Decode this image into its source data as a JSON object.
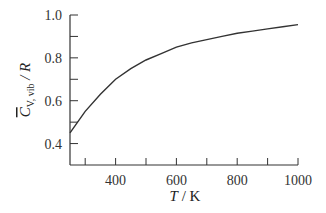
{
  "chart_data": {
    "type": "line",
    "title": "",
    "xlabel": "T / K",
    "ylabel": "C̄V,vib / R",
    "xlim": [
      250,
      1000
    ],
    "ylim": [
      0.3,
      1.0
    ],
    "x_ticks": [
      400,
      600,
      800,
      1000
    ],
    "x_minor_ticks": [
      300,
      500,
      700,
      900
    ],
    "y_ticks": [
      0.4,
      0.6,
      0.8,
      1.0
    ],
    "y_minor_ticks": [
      0.5,
      0.7,
      0.9
    ],
    "x_tick_labels": [
      "400",
      "600",
      "800",
      "1000"
    ],
    "y_tick_labels": [
      "0.4",
      "0.6",
      "0.8",
      "1.0"
    ],
    "grid": false,
    "legend": null,
    "series": [
      {
        "name": "C_V,vib / R",
        "x": [
          250,
          300,
          350,
          400,
          450,
          500,
          550,
          600,
          650,
          700,
          750,
          800,
          850,
          900,
          950,
          1000
        ],
        "y": [
          0.45,
          0.55,
          0.63,
          0.7,
          0.75,
          0.79,
          0.82,
          0.85,
          0.87,
          0.885,
          0.9,
          0.915,
          0.925,
          0.935,
          0.945,
          0.955
        ]
      }
    ]
  },
  "labels": {
    "y_axis": {
      "main": "C",
      "subscript": "V, vib",
      "suffix": " / R"
    },
    "x_axis": {
      "main": "T",
      "suffix": " /  K"
    }
  },
  "colors": {
    "line": "#333333",
    "axis": "#333333"
  }
}
